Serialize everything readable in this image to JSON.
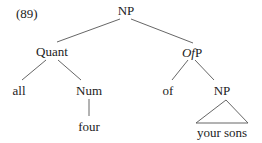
{
  "example_number": "(89)",
  "tree": {
    "root": "NP",
    "nodes": {
      "np_root": "NP",
      "quant": "Quant",
      "ofp_italic": "Of",
      "ofp_rest": "P",
      "all": "all",
      "num": "Num",
      "of": "of",
      "np_inner": "NP",
      "four": "four",
      "your_sons": "your sons"
    },
    "structure": "[NP [Quant all [Num four]] [OfP of [NP your sons]]]"
  }
}
